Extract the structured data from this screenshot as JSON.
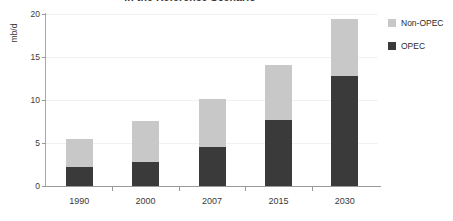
{
  "chart_data": {
    "type": "bar",
    "stacked": true,
    "title": "in the Reference Scenario",
    "xlabel": "",
    "ylabel": "mb/d",
    "categories": [
      "1990",
      "2000",
      "2007",
      "2015",
      "2030"
    ],
    "series": [
      {
        "name": "OPEC",
        "color": "#3a3a3a",
        "values": [
          2.2,
          2.8,
          4.5,
          7.7,
          12.8
        ]
      },
      {
        "name": "Non-OPEC",
        "color": "#c8c8c8",
        "values": [
          3.3,
          4.8,
          5.6,
          6.4,
          6.6
        ]
      }
    ],
    "totals": [
      5.5,
      7.6,
      10.1,
      14.1,
      19.4
    ],
    "ylim": [
      0,
      20
    ],
    "yticks": [
      "0",
      "5",
      "10",
      "15",
      "20"
    ],
    "ytick_values": [
      0,
      5,
      10,
      15,
      20
    ],
    "grid": true,
    "legend_position": "right"
  },
  "legend": {
    "items": [
      {
        "label": "Non-OPEC",
        "color": "#c8c8c8"
      },
      {
        "label": "OPEC",
        "color": "#3a3a3a"
      }
    ]
  }
}
